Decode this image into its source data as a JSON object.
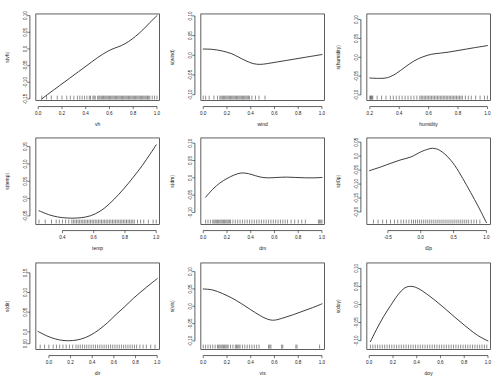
{
  "figure": {
    "title": "",
    "layout": "3x3 grid of GAM partial effect (smooth term) plots",
    "background_color": "#ffffff",
    "line_color": "#1a1a1a",
    "panel_count": 9
  },
  "chart_data": [
    {
      "type": "line",
      "title": "",
      "xlabel": "vh",
      "ylabel": "s(vh)",
      "xlim": [
        -0.02,
        1.02
      ],
      "ylim": [
        -0.155,
        0.105
      ],
      "xticks": [
        "0.0",
        "0.2",
        "0.4",
        "0.6",
        "0.8",
        "1.0"
      ],
      "xtick_values": [
        0.0,
        0.2,
        0.4,
        0.6,
        0.8,
        1.0
      ],
      "yticks": [
        "-0.15",
        "-0.10",
        "-0.05",
        "0.0",
        "0.05",
        "0.10"
      ],
      "ytick_values": [
        -0.15,
        -0.1,
        -0.05,
        0.0,
        0.05,
        0.1
      ],
      "grid": false,
      "legend": "none",
      "rug": true,
      "x": [
        0.03,
        0.1,
        0.18,
        0.26,
        0.34,
        0.42,
        0.5,
        0.58,
        0.64,
        0.7,
        0.76,
        0.82,
        0.88,
        0.94,
        1.0
      ],
      "y": [
        -0.15,
        -0.131,
        -0.11,
        -0.089,
        -0.068,
        -0.047,
        -0.026,
        -0.008,
        0.002,
        0.01,
        0.022,
        0.038,
        0.057,
        0.079,
        0.1
      ],
      "rug_x": [
        0.03,
        0.07,
        0.11,
        0.16,
        0.2,
        0.24,
        0.27,
        0.3,
        0.33,
        0.35,
        0.37,
        0.39,
        0.41,
        0.43,
        0.44,
        0.46,
        0.47,
        0.48,
        0.5,
        0.51,
        0.52,
        0.53,
        0.54,
        0.55,
        0.56,
        0.57,
        0.58,
        0.59,
        0.6,
        0.61,
        0.62,
        0.63,
        0.64,
        0.65,
        0.66,
        0.67,
        0.68,
        0.69,
        0.7,
        0.71,
        0.72,
        0.73,
        0.74,
        0.75,
        0.76,
        0.77,
        0.78,
        0.79,
        0.8,
        0.81,
        0.82,
        0.83,
        0.84,
        0.85,
        0.86,
        0.87,
        0.88,
        0.89,
        0.9,
        0.91,
        0.92,
        0.93,
        0.94,
        0.96,
        0.98,
        1.0
      ]
    },
    {
      "type": "line",
      "title": "",
      "xlabel": "wind",
      "ylabel": "s(wind)",
      "xlim": [
        -0.02,
        1.02
      ],
      "ylim": [
        -0.115,
        0.105
      ],
      "xticks": [
        "0.0",
        "0.2",
        "0.4",
        "0.6",
        "0.8",
        "1.0"
      ],
      "xtick_values": [
        0.0,
        0.2,
        0.4,
        0.6,
        0.8,
        1.0
      ],
      "yticks": [
        "-0.10",
        "-0.05",
        "0.0",
        "0.05",
        "0.10"
      ],
      "ytick_values": [
        -0.1,
        -0.05,
        0.0,
        0.05,
        0.1
      ],
      "grid": false,
      "legend": "none",
      "rug": true,
      "x": [
        0.0,
        0.08,
        0.16,
        0.24,
        0.3,
        0.36,
        0.42,
        0.48,
        0.54,
        0.62,
        0.7,
        0.78,
        0.86,
        0.94,
        1.0
      ],
      "y": [
        0.016,
        0.015,
        0.011,
        0.004,
        -0.005,
        -0.014,
        -0.021,
        -0.023,
        -0.021,
        -0.017,
        -0.013,
        -0.009,
        -0.005,
        -0.001,
        0.002
      ],
      "rug_x": [
        0.0,
        0.02,
        0.05,
        0.09,
        0.12,
        0.14,
        0.15,
        0.16,
        0.17,
        0.18,
        0.19,
        0.2,
        0.21,
        0.22,
        0.23,
        0.24,
        0.25,
        0.26,
        0.27,
        0.28,
        0.29,
        0.3,
        0.31,
        0.32,
        0.33,
        0.34,
        0.35,
        0.36,
        0.37,
        0.38,
        0.39,
        0.41,
        0.44,
        0.47,
        0.52
      ]
    },
    {
      "type": "line",
      "title": "",
      "xlabel": "humidity",
      "ylabel": "s(humidity)",
      "xlim": [
        0.18,
        1.02
      ],
      "ylim": [
        -0.115,
        0.115
      ],
      "xticks": [
        "0.2",
        "0.4",
        "0.6",
        "0.8",
        "1.0"
      ],
      "xtick_values": [
        0.2,
        0.4,
        0.6,
        0.8,
        1.0
      ],
      "yticks": [
        "-0.10",
        "-0.05",
        "0.0",
        "0.05",
        "0.10"
      ],
      "ytick_values": [
        -0.1,
        -0.05,
        0.0,
        0.05,
        0.1
      ],
      "grid": false,
      "legend": "none",
      "rug": true,
      "x": [
        0.2,
        0.26,
        0.32,
        0.38,
        0.44,
        0.5,
        0.56,
        0.62,
        0.68,
        0.74,
        0.8,
        0.86,
        0.92,
        1.0
      ],
      "y": [
        -0.055,
        -0.056,
        -0.054,
        -0.043,
        -0.026,
        -0.01,
        0.001,
        0.008,
        0.011,
        0.014,
        0.018,
        0.022,
        0.026,
        0.031
      ],
      "rug_x": [
        0.2,
        0.205,
        0.21,
        0.215,
        0.22,
        0.25,
        0.28,
        0.31,
        0.34,
        0.36,
        0.38,
        0.4,
        0.42,
        0.44,
        0.46,
        0.48,
        0.5,
        0.52,
        0.54,
        0.55,
        0.56,
        0.57,
        0.58,
        0.59,
        0.6,
        0.61,
        0.62,
        0.63,
        0.64,
        0.65,
        0.66,
        0.67,
        0.68,
        0.69,
        0.7,
        0.71,
        0.72,
        0.73,
        0.74,
        0.75,
        0.76,
        0.77,
        0.78,
        0.79,
        0.8,
        0.81,
        0.82,
        0.83,
        0.85,
        0.87,
        0.89,
        0.92,
        0.95,
        0.98,
        1.0
      ]
    },
    {
      "type": "line",
      "title": "",
      "xlabel": "temp",
      "ylabel": "s(temp)",
      "xlim": [
        0.23,
        1.02
      ],
      "ylim": [
        -0.075,
        0.175
      ],
      "xticks": [
        "0.4",
        "0.6",
        "0.8",
        "1.0"
      ],
      "xtick_values": [
        0.4,
        0.6,
        0.8,
        1.0
      ],
      "yticks": [
        "-0.05",
        "0.0",
        "0.05",
        "0.10",
        "0.15"
      ],
      "ytick_values": [
        -0.05,
        0.0,
        0.05,
        0.1,
        0.15
      ],
      "grid": false,
      "legend": "none",
      "rug": true,
      "x": [
        0.25,
        0.31,
        0.37,
        0.43,
        0.49,
        0.55,
        0.61,
        0.67,
        0.73,
        0.79,
        0.85,
        0.91,
        0.96,
        1.0
      ],
      "y": [
        -0.035,
        -0.046,
        -0.053,
        -0.056,
        -0.056,
        -0.053,
        -0.044,
        -0.027,
        -0.002,
        0.027,
        0.06,
        0.095,
        0.128,
        0.155
      ],
      "rug_x": [
        0.25,
        0.29,
        0.33,
        0.36,
        0.38,
        0.4,
        0.42,
        0.44,
        0.46,
        0.47,
        0.48,
        0.49,
        0.5,
        0.51,
        0.52,
        0.53,
        0.54,
        0.55,
        0.56,
        0.57,
        0.58,
        0.59,
        0.6,
        0.61,
        0.62,
        0.63,
        0.64,
        0.65,
        0.66,
        0.67,
        0.68,
        0.69,
        0.7,
        0.71,
        0.72,
        0.73,
        0.74,
        0.75,
        0.76,
        0.77,
        0.78,
        0.79,
        0.8,
        0.81,
        0.82,
        0.83,
        0.84,
        0.85,
        0.86,
        0.88,
        0.9,
        0.92,
        0.95,
        0.98,
        1.0
      ]
    },
    {
      "type": "line",
      "title": "",
      "xlabel": "dm",
      "ylabel": "s(dm)",
      "xlim": [
        -0.02,
        1.02
      ],
      "ylim": [
        -0.135,
        0.115
      ],
      "xticks": [
        "0.0",
        "0.2",
        "0.4",
        "0.6",
        "0.8",
        "1.0"
      ],
      "xtick_values": [
        0.0,
        0.2,
        0.4,
        0.6,
        0.8,
        1.0
      ],
      "yticks": [
        "-0.10",
        "-0.05",
        "0.0",
        "0.05",
        "0.10"
      ],
      "ytick_values": [
        -0.1,
        -0.05,
        0.0,
        0.05,
        0.1
      ],
      "grid": false,
      "legend": "none",
      "rug": true,
      "x": [
        0.02,
        0.08,
        0.14,
        0.2,
        0.26,
        0.32,
        0.38,
        0.44,
        0.5,
        0.56,
        0.62,
        0.7,
        0.78,
        0.86,
        0.94,
        1.0
      ],
      "y": [
        -0.056,
        -0.033,
        -0.015,
        -0.002,
        0.008,
        0.014,
        0.012,
        0.006,
        0.001,
        0.0,
        0.001,
        0.002,
        0.001,
        0.0,
        0.0,
        0.001
      ],
      "rug_x": [
        0.02,
        0.04,
        0.06,
        0.08,
        0.09,
        0.1,
        0.11,
        0.12,
        0.13,
        0.14,
        0.15,
        0.16,
        0.17,
        0.18,
        0.19,
        0.2,
        0.21,
        0.22,
        0.23,
        0.25,
        0.27,
        0.29,
        0.31,
        0.33,
        0.35,
        0.37,
        0.39,
        0.41,
        0.43,
        0.45,
        0.47,
        0.49,
        0.51,
        0.53,
        0.55,
        0.57,
        0.59,
        0.61,
        0.63,
        0.65,
        0.67,
        0.69,
        0.71,
        0.74,
        0.77,
        0.8,
        0.83,
        0.86,
        0.97,
        0.98,
        0.99,
        1.0
      ]
    },
    {
      "type": "line",
      "title": "",
      "xlabel": "t0p",
      "ylabel": "s(t0p)",
      "xlim": [
        -0.82,
        1.06
      ],
      "ylim": [
        -0.245,
        0.065
      ],
      "xticks": [
        "-0.5",
        "0.0",
        "0.5",
        "1.0"
      ],
      "xtick_values": [
        -0.5,
        0.0,
        0.5,
        1.0
      ],
      "yticks": [
        "-0.20",
        "-0.15",
        "-0.10",
        "-0.05",
        "0.0",
        "0.05"
      ],
      "ytick_values": [
        -0.2,
        -0.15,
        -0.1,
        -0.05,
        0.0,
        0.05
      ],
      "grid": false,
      "legend": "none",
      "rug": true,
      "x": [
        -0.78,
        -0.6,
        -0.45,
        -0.3,
        -0.15,
        0.0,
        0.1,
        0.18,
        0.28,
        0.4,
        0.52,
        0.64,
        0.76,
        0.88,
        1.0
      ],
      "y": [
        -0.052,
        -0.038,
        -0.025,
        -0.013,
        -0.003,
        0.015,
        0.024,
        0.028,
        0.022,
        0.0,
        -0.034,
        -0.08,
        -0.13,
        -0.182,
        -0.238
      ],
      "rug_x": [
        -0.72,
        -0.65,
        -0.58,
        -0.52,
        -0.46,
        -0.4,
        -0.35,
        -0.3,
        -0.26,
        -0.22,
        -0.18,
        -0.14,
        -0.11,
        -0.08,
        -0.05,
        -0.02,
        0.01,
        0.04,
        0.07,
        0.1,
        0.13,
        0.16,
        0.19,
        0.22,
        0.25,
        0.28,
        0.31,
        0.34,
        0.37,
        0.4,
        0.43,
        0.46,
        0.49,
        0.52,
        0.55,
        0.58,
        0.61,
        0.64,
        0.67,
        0.7,
        0.73,
        0.77,
        0.81,
        0.85,
        0.9
      ]
    },
    {
      "type": "line",
      "title": "",
      "xlabel": "dir",
      "ylabel": "s(dir)",
      "xlim": [
        -0.12,
        1.02
      ],
      "ylim": [
        -0.045,
        0.175
      ],
      "xticks": [
        "0.0",
        "0.2",
        "0.4",
        "0.6",
        "0.8",
        "1.0"
      ],
      "xtick_values": [
        0.0,
        0.2,
        0.4,
        0.6,
        0.8,
        1.0
      ],
      "yticks": [
        "0.00",
        "0.0",
        "0.05",
        "0.10",
        "0.15"
      ],
      "ytick_values": [
        -0.03,
        0.0,
        0.05,
        0.1,
        0.15
      ],
      "grid": false,
      "legend": "none",
      "rug": true,
      "x": [
        -0.1,
        -0.02,
        0.06,
        0.14,
        0.22,
        0.3,
        0.38,
        0.46,
        0.54,
        0.62,
        0.7,
        0.78,
        0.86,
        0.94,
        1.0
      ],
      "y": [
        0.001,
        -0.01,
        -0.018,
        -0.022,
        -0.022,
        -0.018,
        -0.009,
        0.005,
        0.023,
        0.044,
        0.064,
        0.085,
        0.104,
        0.122,
        0.135
      ],
      "rug_x": [
        -0.08,
        -0.04,
        0.0,
        0.04,
        0.07,
        0.1,
        0.13,
        0.16,
        0.19,
        0.22,
        0.25,
        0.27,
        0.29,
        0.31,
        0.33,
        0.35,
        0.37,
        0.39,
        0.41,
        0.43,
        0.45,
        0.47,
        0.49,
        0.51,
        0.53,
        0.55,
        0.57,
        0.59,
        0.61,
        0.63,
        0.65,
        0.67,
        0.69,
        0.71,
        0.73,
        0.75,
        0.77,
        0.79,
        0.81,
        0.84,
        0.87,
        0.9,
        0.94,
        0.98
      ]
    },
    {
      "type": "line",
      "title": "",
      "xlabel": "vis",
      "ylabel": "s(vis)",
      "xlim": [
        -0.02,
        1.02
      ],
      "ylim": [
        -0.125,
        0.125
      ],
      "xticks": [
        "0.0",
        "0.2",
        "0.4",
        "0.6",
        "0.8",
        "1.0"
      ],
      "xtick_values": [
        0.0,
        0.2,
        0.4,
        0.6,
        0.8,
        1.0
      ],
      "yticks": [
        "-0.10",
        "-0.05",
        "0.0",
        "0.05",
        "0.10"
      ],
      "ytick_values": [
        -0.1,
        -0.05,
        0.0,
        0.05,
        0.1
      ],
      "grid": false,
      "legend": "none",
      "rug": true,
      "x": [
        0.0,
        0.08,
        0.16,
        0.24,
        0.32,
        0.4,
        0.48,
        0.54,
        0.6,
        0.68,
        0.76,
        0.84,
        0.92,
        1.0
      ],
      "y": [
        0.05,
        0.047,
        0.037,
        0.024,
        0.008,
        -0.01,
        -0.027,
        -0.037,
        -0.04,
        -0.033,
        -0.024,
        -0.014,
        -0.004,
        0.007
      ],
      "rug_x": [
        0.0,
        0.02,
        0.04,
        0.06,
        0.08,
        0.1,
        0.12,
        0.13,
        0.14,
        0.15,
        0.16,
        0.17,
        0.18,
        0.19,
        0.2,
        0.21,
        0.23,
        0.25,
        0.27,
        0.28,
        0.29,
        0.3,
        0.31,
        0.33,
        0.35,
        0.37,
        0.39,
        0.41,
        0.43,
        0.45,
        0.47,
        0.55,
        0.56,
        0.57,
        0.66,
        0.67,
        0.78,
        0.79,
        0.98
      ]
    },
    {
      "type": "line",
      "title": "",
      "xlabel": "doy",
      "ylabel": "s(doy)",
      "xlim": [
        -0.02,
        1.02
      ],
      "ylim": [
        -0.125,
        0.115
      ],
      "xticks": [
        "0.0",
        "0.2",
        "0.4",
        "0.6",
        "0.8",
        "1.0"
      ],
      "xtick_values": [
        0.0,
        0.2,
        0.4,
        0.6,
        0.8,
        1.0
      ],
      "yticks": [
        "-0.10",
        "-0.05",
        "0.0",
        "0.05",
        "0.10"
      ],
      "ytick_values": [
        -0.1,
        -0.05,
        0.0,
        0.05,
        0.1
      ],
      "grid": false,
      "legend": "none",
      "rug": true,
      "x": [
        0.01,
        0.06,
        0.12,
        0.18,
        0.24,
        0.3,
        0.36,
        0.42,
        0.48,
        0.56,
        0.64,
        0.72,
        0.8,
        0.88,
        0.94,
        1.0
      ],
      "y": [
        -0.103,
        -0.07,
        -0.034,
        -0.003,
        0.026,
        0.046,
        0.05,
        0.043,
        0.03,
        0.01,
        -0.012,
        -0.035,
        -0.057,
        -0.078,
        -0.091,
        -0.101
      ],
      "rug_x": [
        0.01,
        0.03,
        0.05,
        0.07,
        0.09,
        0.11,
        0.13,
        0.15,
        0.17,
        0.19,
        0.21,
        0.23,
        0.25,
        0.27,
        0.29,
        0.31,
        0.33,
        0.35,
        0.37,
        0.39,
        0.41,
        0.43,
        0.45,
        0.47,
        0.49,
        0.51,
        0.53,
        0.55,
        0.57,
        0.59,
        0.61,
        0.63,
        0.65,
        0.67,
        0.69,
        0.71,
        0.73,
        0.75,
        0.77,
        0.79,
        0.81,
        0.83,
        0.85,
        0.87,
        0.89,
        0.91,
        0.93,
        0.95,
        0.97,
        0.99
      ]
    }
  ]
}
